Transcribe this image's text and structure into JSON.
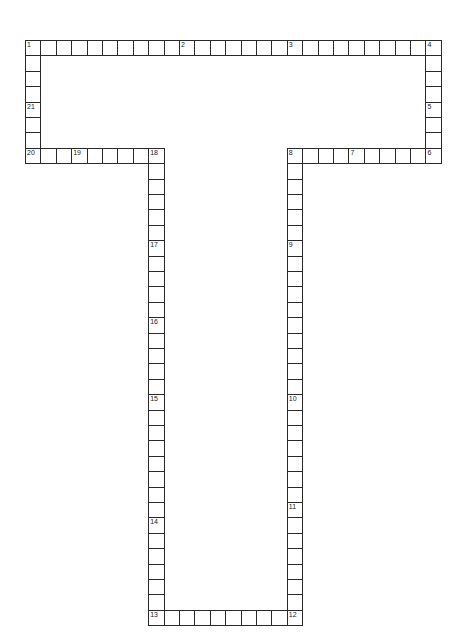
{
  "puzzle": {
    "type": "crossword",
    "shape": "T",
    "cell_size": 15.4,
    "origin": {
      "x": 25,
      "y": 40
    },
    "colors": {
      "line": "#2a2a2a",
      "background": "#ffffff",
      "number": "#222222"
    },
    "segments": [
      {
        "name": "top-row",
        "start": [
          0,
          0
        ],
        "dir": "across",
        "length": 27
      },
      {
        "name": "left-column",
        "start": [
          0,
          1
        ],
        "dir": "down",
        "length": 7
      },
      {
        "name": "row-20",
        "start": [
          1,
          7
        ],
        "dir": "across",
        "length": 8
      },
      {
        "name": "right-column",
        "start": [
          26,
          1
        ],
        "dir": "down",
        "length": 7
      },
      {
        "name": "row-8",
        "start": [
          17,
          7
        ],
        "dir": "across",
        "length": 9
      },
      {
        "name": "left-stem",
        "start": [
          8,
          8
        ],
        "dir": "down",
        "length": 30
      },
      {
        "name": "right-stem",
        "start": [
          17,
          8
        ],
        "dir": "down",
        "length": 30
      },
      {
        "name": "bottom-row",
        "start": [
          9,
          37
        ],
        "dir": "across",
        "length": 8
      }
    ],
    "numbers": [
      {
        "n": "1",
        "col": 0,
        "row": 0
      },
      {
        "n": "2",
        "col": 10,
        "row": 0
      },
      {
        "n": "3",
        "col": 17,
        "row": 0
      },
      {
        "n": "4",
        "col": 26,
        "row": 0
      },
      {
        "n": "5",
        "col": 26,
        "row": 4
      },
      {
        "n": "6",
        "col": 26,
        "row": 7
      },
      {
        "n": "7",
        "col": 21,
        "row": 7
      },
      {
        "n": "8",
        "col": 17,
        "row": 7
      },
      {
        "n": "9",
        "col": 17,
        "row": 13
      },
      {
        "n": "10",
        "col": 17,
        "row": 23
      },
      {
        "n": "11",
        "col": 17,
        "row": 30
      },
      {
        "n": "12",
        "col": 17,
        "row": 37
      },
      {
        "n": "13",
        "col": 8,
        "row": 37
      },
      {
        "n": "14",
        "col": 8,
        "row": 31
      },
      {
        "n": "15",
        "col": 8,
        "row": 23
      },
      {
        "n": "16",
        "col": 8,
        "row": 18
      },
      {
        "n": "17",
        "col": 8,
        "row": 13
      },
      {
        "n": "18",
        "col": 8,
        "row": 7
      },
      {
        "n": "19",
        "col": 3,
        "row": 7
      },
      {
        "n": "20",
        "col": 0,
        "row": 7
      },
      {
        "n": "21",
        "col": 0,
        "row": 4
      }
    ]
  }
}
